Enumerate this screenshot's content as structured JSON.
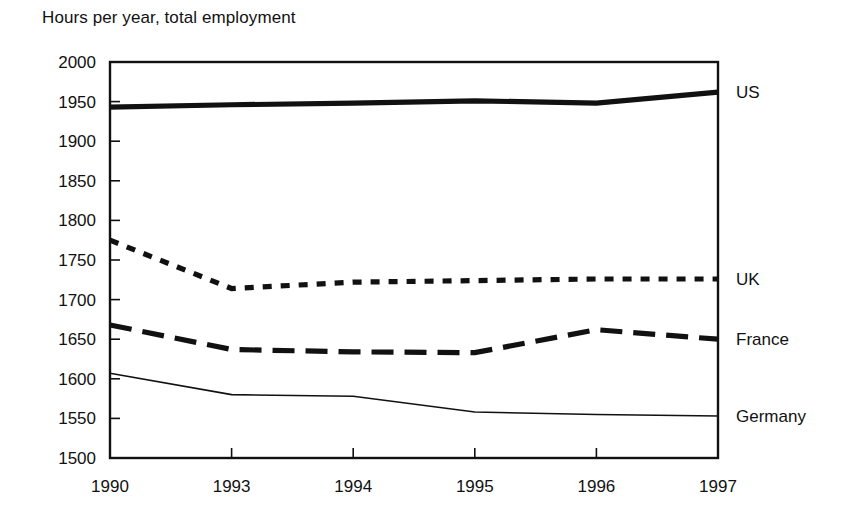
{
  "chart_data": {
    "type": "line",
    "title": "Hours per year, total employment",
    "xlabel": "",
    "ylabel": "",
    "ylim": [
      1500,
      2000
    ],
    "ytick_step": 50,
    "yticks": [
      2000,
      1950,
      1900,
      1850,
      1800,
      1750,
      1700,
      1650,
      1600,
      1550,
      1500
    ],
    "grid": false,
    "legend_position": "right-inline",
    "categories": [
      "1990",
      "1993",
      "1994",
      "1995",
      "1996",
      "1997"
    ],
    "series": [
      {
        "name": "US",
        "label": "US",
        "style": "thick-solid",
        "values": [
          1943,
          1946,
          1948,
          1951,
          1948,
          1962
        ]
      },
      {
        "name": "UK",
        "label": "UK",
        "style": "dotted",
        "values": [
          1775,
          1714,
          1722,
          1724,
          1726,
          1726
        ]
      },
      {
        "name": "France",
        "label": "France",
        "style": "dashed",
        "values": [
          1668,
          1637,
          1634,
          1633,
          1662,
          1650
        ]
      },
      {
        "name": "Germany",
        "label": "Germany",
        "style": "thin-solid",
        "values": [
          1607,
          1580,
          1578,
          1558,
          1555,
          1553
        ]
      }
    ]
  },
  "colors": {
    "ink": "#111111",
    "background": "#ffffff"
  }
}
